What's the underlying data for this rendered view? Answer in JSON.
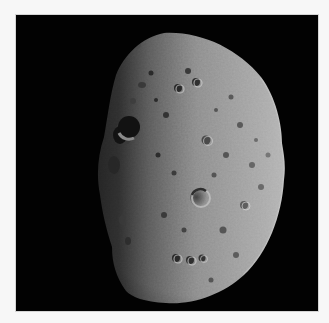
{
  "image": {
    "subject": "asteroid",
    "description": "Cratered, partially lit asteroid against black space; illuminated from the right, terminator running vertically through the left third.",
    "background_color": "#000000",
    "frame_color": "#f7f7f7",
    "border_color": "#d4d4d4",
    "surface_lit_color": "#b8b8b8",
    "surface_mid_color": "#6e6e6e",
    "surface_dark_color": "#1a1a1a"
  }
}
